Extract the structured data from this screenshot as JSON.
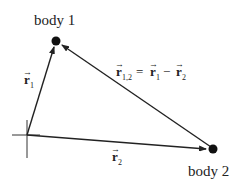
{
  "diagram": {
    "type": "vector-diagram",
    "bodies": [
      {
        "label": "body 1",
        "x": 56,
        "y": 41
      },
      {
        "label": "body 2",
        "x": 213,
        "y": 149
      }
    ],
    "origin": {
      "x": 27,
      "y": 135
    },
    "vectors": {
      "r1": {
        "symbol": "r",
        "subscript": "1",
        "from": "origin",
        "to": "body 1"
      },
      "r2": {
        "symbol": "r",
        "subscript": "2",
        "from": "origin",
        "to": "body 2"
      },
      "r12": {
        "symbol": "r",
        "subscript": "1,2",
        "from": "body 2",
        "to": "body 1"
      }
    },
    "equation": {
      "lhs_symbol": "r",
      "lhs_sub": "1,2",
      "eq": "=",
      "t1_symbol": "r",
      "t1_sub": "1",
      "minus": "−",
      "t2_symbol": "r",
      "t2_sub": "2"
    },
    "arrow_accent": "→",
    "colors": {
      "line": "#222222",
      "background": "#ffffff"
    }
  }
}
